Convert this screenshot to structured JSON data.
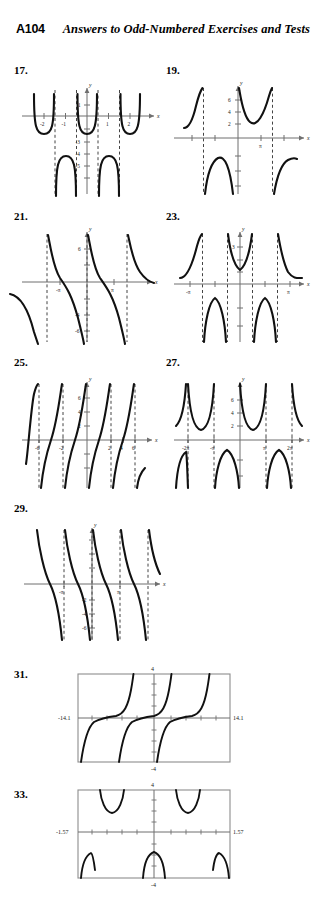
{
  "header": {
    "folio": "A104",
    "running_head": "Answers to Odd-Numbered Exercises and Tests"
  },
  "answers": [
    {
      "number": "17.",
      "axis_labels": {
        "x": "x",
        "y": "y"
      },
      "x_ticks": [
        "-2",
        "-1",
        "1",
        "2"
      ],
      "y_ticks": [
        "1",
        "-3",
        "-4",
        "-5"
      ],
      "curve_type": "secant"
    },
    {
      "number": "19.",
      "axis_labels": {
        "x": "x",
        "y": "y"
      },
      "x_ticks": [
        "π"
      ],
      "y_ticks": [
        "6",
        "4",
        "2"
      ],
      "curve_type": "secant"
    },
    {
      "number": "21.",
      "axis_labels": {
        "x": "x",
        "y": "y"
      },
      "x_ticks": [
        "-π",
        "π"
      ],
      "y_ticks": [
        "6",
        "-4",
        "-6"
      ],
      "curve_type": "cotangent"
    },
    {
      "number": "23.",
      "axis_labels": {
        "x": "x",
        "y": "y"
      },
      "x_ticks": [
        "-π",
        "π"
      ],
      "y_ticks": [
        "3"
      ],
      "curve_type": "cosecant"
    },
    {
      "number": "25.",
      "axis_labels": {
        "x": "x",
        "y": "y"
      },
      "x_ticks": [
        "-6",
        "-2",
        "2",
        "4",
        "6"
      ],
      "y_ticks": [
        "6",
        "4",
        "2"
      ],
      "curve_type": "tangent"
    },
    {
      "number": "27.",
      "axis_labels": {
        "x": "x",
        "y": "y"
      },
      "x_ticks": [
        "-2π",
        "-π",
        "π",
        "2π"
      ],
      "y_ticks": [
        "6",
        "4",
        "2"
      ],
      "curve_type": "secant"
    },
    {
      "number": "29.",
      "axis_labels": {
        "x": "x",
        "y": "y"
      },
      "x_ticks": [
        "-π",
        "π"
      ],
      "y_ticks": [
        "-2",
        "-4",
        "-6"
      ],
      "curve_type": "cotangent"
    },
    {
      "number": "31.",
      "window": {
        "top": "4",
        "bottom": "-4",
        "left": "-14.1",
        "right": "14.1"
      },
      "curve_type": "tangent"
    },
    {
      "number": "33.",
      "window": {
        "top": "4",
        "bottom": "-4",
        "left": "-1.57",
        "right": "1.57"
      },
      "curve_type": "secant"
    }
  ],
  "colors": {
    "curve": "#111111",
    "axis": "#6f6f6f",
    "asymptote": "#444444",
    "window_border": "#8d8d8d",
    "text": "#000000"
  }
}
